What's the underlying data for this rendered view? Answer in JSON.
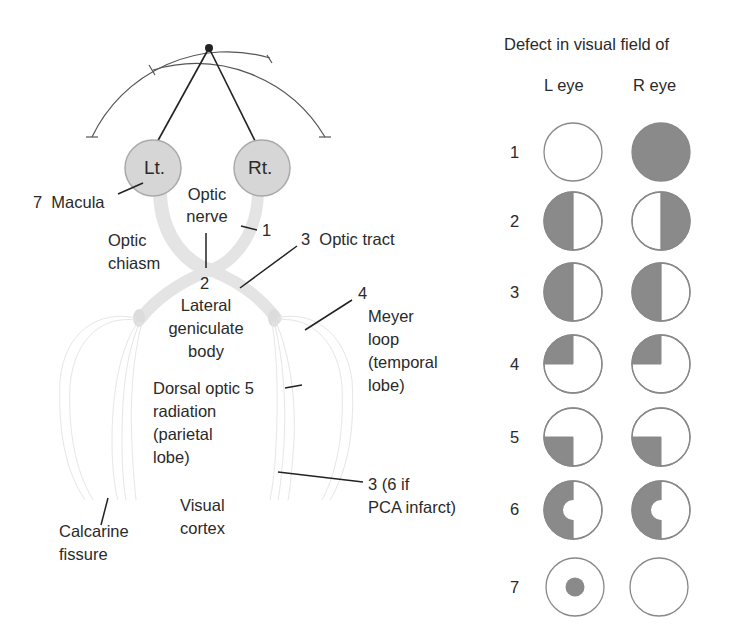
{
  "anatomy": {
    "eyes": {
      "left": "Lt.",
      "right": "Rt."
    },
    "labels": {
      "macula": "7  Macula",
      "optic_nerve_1": "Optic",
      "optic_nerve_2": "nerve",
      "optic_nerve_num": "1",
      "optic_chiasm_1": "Optic",
      "optic_chiasm_2": "chiasm",
      "optic_tract": "3  Optic tract",
      "chiasm_num": "2",
      "lgn_1": "Lateral",
      "lgn_2": "geniculate",
      "lgn_3": "body",
      "meyer_num": "4",
      "meyer_1": "Meyer",
      "meyer_2": "loop",
      "meyer_3": "(temporal",
      "meyer_4": "lobe)",
      "dorsal_1": "Dorsal optic 5",
      "dorsal_2": "radiation",
      "dorsal_3": "(parietal",
      "dorsal_4": "lobe)",
      "cortex_num_1": "3 (6 if",
      "cortex_num_2": "PCA infarct)",
      "calcarine_1": "Calcarine",
      "calcarine_2": "fissure",
      "visual_cortex_1": "Visual",
      "visual_cortex_2": "cortex"
    }
  },
  "field_defects": {
    "title": "Defect in visual field of",
    "columns": [
      "L eye",
      "R eye"
    ],
    "rows": [
      {
        "num": "1",
        "left": "none",
        "right": "full"
      },
      {
        "num": "2",
        "left": "left-half",
        "right": "right-half"
      },
      {
        "num": "3",
        "left": "left-half",
        "right": "left-half"
      },
      {
        "num": "4",
        "left": "upper-left-quadrant",
        "right": "upper-left-quadrant"
      },
      {
        "num": "5",
        "left": "lower-left-quadrant",
        "right": "lower-left-quadrant"
      },
      {
        "num": "6",
        "left": "left-half-macular-sparing",
        "right": "left-half-macular-sparing"
      },
      {
        "num": "7",
        "left": "central-scotoma",
        "right": "none"
      }
    ]
  },
  "colors": {
    "defect": "#8a8a8a",
    "outline": "#888888",
    "pathway": "#e3e3e3",
    "eye": "#d6d6d6",
    "line": "#222222"
  }
}
